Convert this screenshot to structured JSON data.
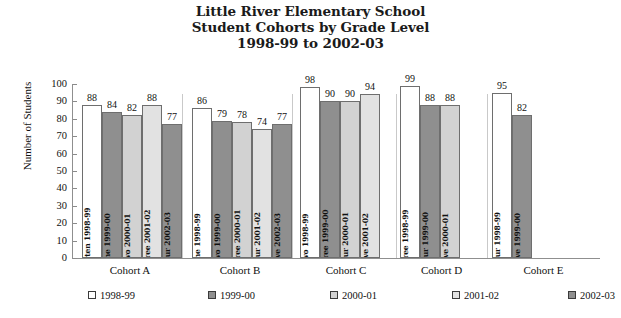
{
  "title": {
    "line1": "Little River Elementary School",
    "line2": "Student Cohorts by Grade Level",
    "line3": "1998-99 to 2002-03"
  },
  "axis": {
    "y_label": "Number of Students",
    "y_ticks": [
      "100",
      "90",
      "80",
      "70",
      "60",
      "50",
      "40",
      "30",
      "20",
      "10",
      "0"
    ]
  },
  "legend": {
    "items": [
      {
        "label": "1998-99",
        "color": "#ffffff"
      },
      {
        "label": "1999-00",
        "color": "#8f8f8f"
      },
      {
        "label": "2000-01",
        "color": "#d2d2d2"
      },
      {
        "label": "2001-02",
        "color": "#e2e2e2"
      },
      {
        "label": "2002-03",
        "color": "#8f8f8f"
      }
    ]
  },
  "chart_data": {
    "type": "bar",
    "title": "Little River Elementary School Student Cohorts by Grade Level 1998-99 to 2002-03",
    "xlabel": "",
    "ylabel": "Number of Students",
    "ylim": [
      0,
      100
    ],
    "ytick_step": 10,
    "grid": false,
    "legend_position": "bottom",
    "categories": [
      "Cohort A",
      "Cohort B",
      "Cohort C",
      "Cohort D",
      "Cohort E"
    ],
    "series": [
      {
        "name": "1998-99",
        "color": "#ffffff",
        "values": [
          88,
          86,
          98,
          99,
          95
        ]
      },
      {
        "name": "1999-00",
        "color": "#8f8f8f",
        "values": [
          84,
          79,
          90,
          88,
          82
        ]
      },
      {
        "name": "2000-01",
        "color": "#d2d2d2",
        "values": [
          82,
          78,
          90,
          88,
          null
        ]
      },
      {
        "name": "2001-02",
        "color": "#e2e2e2",
        "values": [
          88,
          74,
          94,
          null,
          null
        ]
      },
      {
        "name": "2002-03",
        "color": "#8f8f8f",
        "values": [
          77,
          77,
          null,
          null,
          null
        ]
      }
    ],
    "groups": [
      {
        "cohort": "Cohort A",
        "bars": [
          {
            "label": "Kindergarten 1998-99",
            "value": 88,
            "series": "1998-99",
            "color": "#ffffff"
          },
          {
            "label": "Grade One 1999-00",
            "value": 84,
            "series": "1999-00",
            "color": "#8f8f8f"
          },
          {
            "label": "Grade Two 2000-01",
            "value": 82,
            "series": "2000-01",
            "color": "#d2d2d2"
          },
          {
            "label": "Grade Three 2001-02",
            "value": 88,
            "series": "2001-02",
            "color": "#e2e2e2"
          },
          {
            "label": "Grade Four 2002-03",
            "value": 77,
            "series": "2002-03",
            "color": "#8f8f8f"
          }
        ]
      },
      {
        "cohort": "Cohort B",
        "bars": [
          {
            "label": "Grade One 1998-99",
            "value": 86,
            "series": "1998-99",
            "color": "#ffffff"
          },
          {
            "label": "Grade Two 1999-00",
            "value": 79,
            "series": "1999-00",
            "color": "#8f8f8f"
          },
          {
            "label": "Grade Three 2000-01",
            "value": 78,
            "series": "2000-01",
            "color": "#d2d2d2"
          },
          {
            "label": "Grade Four 2001-02",
            "value": 74,
            "series": "2001-02",
            "color": "#e2e2e2"
          },
          {
            "label": "Grade Five 2002-03",
            "value": 77,
            "series": "2002-03",
            "color": "#8f8f8f"
          }
        ]
      },
      {
        "cohort": "Cohort C",
        "bars": [
          {
            "label": "Grade Two 1998-99",
            "value": 98,
            "series": "1998-99",
            "color": "#ffffff"
          },
          {
            "label": "Grade Three 1999-00",
            "value": 90,
            "series": "1999-00",
            "color": "#8f8f8f"
          },
          {
            "label": "Grade Four 2000-01",
            "value": 90,
            "series": "2000-01",
            "color": "#d2d2d2"
          },
          {
            "label": "Grade Five 2001-02",
            "value": 94,
            "series": "2001-02",
            "color": "#e2e2e2"
          }
        ]
      },
      {
        "cohort": "Cohort D",
        "bars": [
          {
            "label": "Grade Three 1998-99",
            "value": 99,
            "series": "1998-99",
            "color": "#ffffff"
          },
          {
            "label": "Grade Four 1999-00",
            "value": 88,
            "series": "1999-00",
            "color": "#8f8f8f"
          },
          {
            "label": "Grade Five 2000-01",
            "value": 88,
            "series": "2000-01",
            "color": "#d2d2d2"
          }
        ]
      },
      {
        "cohort": "Cohort E",
        "bars": [
          {
            "label": "Grade Four 1998-99",
            "value": 95,
            "series": "1998-99",
            "color": "#ffffff"
          },
          {
            "label": "Grade Five 1999-00",
            "value": 82,
            "series": "1999-00",
            "color": "#8f8f8f"
          }
        ]
      }
    ]
  }
}
